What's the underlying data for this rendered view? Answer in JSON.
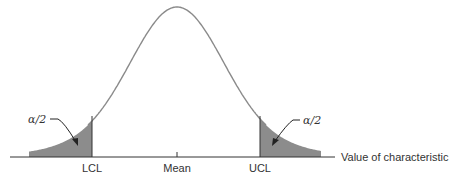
{
  "diagram": {
    "axis_label": "Value of characteristic",
    "ticks": [
      {
        "label": "LCL",
        "x": 92
      },
      {
        "label": "Mean",
        "x": 177
      },
      {
        "label": "UCL",
        "x": 260
      }
    ],
    "tail_labels": {
      "left": "α/2",
      "right": "α/2"
    },
    "colors": {
      "curve": "#8a8a8a",
      "shade": "#8c8c8c",
      "axis": "#333333",
      "text": "#333333"
    }
  }
}
